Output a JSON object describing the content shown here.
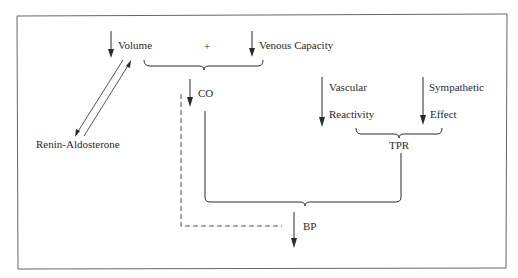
{
  "diagram": {
    "type": "flow",
    "labels": {
      "volume": "Volume",
      "plus": "+",
      "venous_capacity": "Venous Capacity",
      "renin_aldosterone": "Renin-Aldosterone",
      "co": "CO",
      "vascular": "Vascular",
      "reactivity": "Reactivity",
      "sympathetic": "Sympathetic",
      "effect": "Effect",
      "tpr": "TPR",
      "bp": "BP"
    },
    "nodes": [
      {
        "id": "volume",
        "label": "Volume",
        "direction": "down"
      },
      {
        "id": "venous_capacity",
        "label": "Venous Capacity",
        "direction": "down"
      },
      {
        "id": "renin_aldosterone",
        "label": "Renin-Aldosterone"
      },
      {
        "id": "co",
        "label": "CO",
        "direction": "down"
      },
      {
        "id": "vascular_reactivity",
        "label": "Vascular Reactivity",
        "direction": "down"
      },
      {
        "id": "sympathetic_effect",
        "label": "Sympathetic Effect",
        "direction": "down"
      },
      {
        "id": "tpr",
        "label": "TPR"
      },
      {
        "id": "bp",
        "label": "BP",
        "direction": "down"
      }
    ],
    "edges": [
      {
        "from": "volume",
        "to": "renin_aldosterone",
        "style": "solid",
        "bidirectional": true
      },
      {
        "from": [
          "volume",
          "venous_capacity"
        ],
        "to": "co",
        "style": "brace"
      },
      {
        "from": [
          "vascular_reactivity",
          "sympathetic_effect"
        ],
        "to": "tpr",
        "style": "brace"
      },
      {
        "from": [
          "co",
          "tpr"
        ],
        "to": "bp",
        "style": "brace"
      },
      {
        "from": "co",
        "to": "bp",
        "style": "dashed"
      }
    ],
    "colors": {
      "ink": "#2a2a2a",
      "border": "#555555",
      "background": "#ffffff"
    }
  }
}
